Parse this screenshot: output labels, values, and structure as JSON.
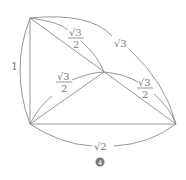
{
  "figure": {
    "label": "4",
    "vertices": {
      "top_left": [
        30,
        18
      ],
      "center": [
        104,
        72
      ],
      "bottom_left": [
        30,
        124
      ],
      "bottom_right": [
        176,
        124
      ]
    },
    "edge_labels": {
      "left": "1",
      "top_left_to_center_num": "√3",
      "top_left_to_center_den": "2",
      "top_left_to_bottom_right": "√3",
      "bottom_left_to_center_num": "√3",
      "bottom_left_to_center_den": "2",
      "center_to_bottom_right_num": "√3",
      "center_to_bottom_right_den": "2",
      "bottom": "√2"
    }
  }
}
